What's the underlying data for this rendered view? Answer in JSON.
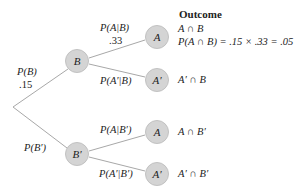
{
  "title": "Outcome",
  "nodes": {
    "b": "B",
    "b_prime": "B′",
    "a_top": "A",
    "a_prime_top": "A′",
    "a_bottom": "A",
    "a_prime_bottom": "A′"
  },
  "branches": {
    "p_b": "P(B)",
    "p_b_value": ".15",
    "p_b_prime": "P(B′)",
    "p_a_given_b": "P(A|B)",
    "p_a_given_b_value": ".33",
    "p_a_prime_given_b": "P(A′|B)",
    "p_a_given_b_prime": "P(A|B′)",
    "p_a_prime_given_b_prime": "P(A′|B′)"
  },
  "outcomes": {
    "a_and_b": "A ∩ B",
    "a_and_b_calc": "P(A ∩ B) = .15 × .33 = .05",
    "a_prime_and_b": "A′ ∩ B",
    "a_and_b_prime": "A ∩ B′",
    "a_prime_and_b_prime": "A′ ∩ B′"
  },
  "colors": {
    "node_fill": "#d4d4d4",
    "line": "#a8a8a8",
    "text": "#222222"
  }
}
